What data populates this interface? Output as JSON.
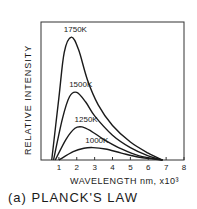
{
  "caption": "(a) PLANCK'S LAW",
  "chart_data": {
    "type": "line",
    "title": "(a) PLANCK'S LAW",
    "xlabel": "WAVELENGTH nm, x10³",
    "ylabel": "RELATIVE INTENSITY",
    "xlim": [
      0,
      8
    ],
    "ylim": [
      0,
      1
    ],
    "xticks": [
      "1",
      "2",
      "3",
      "4",
      "5",
      "6",
      "7",
      "8"
    ],
    "grid": false,
    "legend": "inline labels above each curve peak",
    "series": [
      {
        "name": "1750K",
        "label": "1750K",
        "peak_x": 1.7,
        "peak_y": 0.89,
        "x": [
          0.6,
          1.0,
          1.3,
          1.7,
          2.1,
          2.6,
          3.2,
          4.0,
          5.0,
          6.0,
          6.8
        ],
        "y": [
          0.0,
          0.45,
          0.78,
          0.89,
          0.8,
          0.58,
          0.4,
          0.25,
          0.13,
          0.05,
          0.0
        ]
      },
      {
        "name": "1500K",
        "label": "1500K",
        "peak_x": 2.0,
        "peak_y": 0.49,
        "x": [
          0.7,
          1.2,
          1.6,
          2.0,
          2.5,
          3.0,
          4.0,
          5.0,
          6.0,
          6.8
        ],
        "y": [
          0.0,
          0.3,
          0.46,
          0.49,
          0.42,
          0.32,
          0.18,
          0.09,
          0.03,
          0.0
        ]
      },
      {
        "name": "1250K",
        "label": "1250K",
        "peak_x": 2.3,
        "peak_y": 0.24,
        "x": [
          0.8,
          1.4,
          1.9,
          2.3,
          2.8,
          3.5,
          4.5,
          5.5,
          6.8
        ],
        "y": [
          0.0,
          0.15,
          0.23,
          0.24,
          0.21,
          0.15,
          0.08,
          0.03,
          0.0
        ]
      },
      {
        "name": "1000K",
        "label": "1000K",
        "peak_x": 2.9,
        "peak_y": 0.09,
        "x": [
          1.0,
          1.8,
          2.4,
          2.9,
          3.6,
          4.5,
          5.5,
          6.8
        ],
        "y": [
          0.0,
          0.06,
          0.085,
          0.09,
          0.08,
          0.05,
          0.02,
          0.0
        ]
      }
    ]
  }
}
